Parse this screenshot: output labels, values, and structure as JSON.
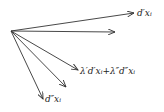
{
  "diagram": {
    "origin": [
      11,
      31
    ],
    "vectors": [
      {
        "id": "v1",
        "to": [
          134,
          13
        ],
        "label": "d′xᵢ"
      },
      {
        "id": "v2",
        "to": [
          115,
          32
        ],
        "label": ""
      },
      {
        "id": "v3",
        "to": [
          78,
          70
        ],
        "label": "λ′d′xᵢ+λ″d″xᵢ"
      },
      {
        "id": "v4",
        "to": [
          66,
          87
        ],
        "label": ""
      },
      {
        "id": "v5",
        "to": [
          43,
          99
        ],
        "label": "d″xᵢ"
      }
    ],
    "stroke_color": "#333333"
  }
}
